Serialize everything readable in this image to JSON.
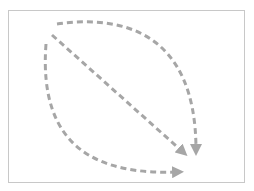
{
  "diagram": {
    "frame": {
      "x": 8,
      "y": 10,
      "width": 237,
      "height": 173,
      "border_color": "#c8c8c8"
    },
    "stroke_color": "#a6a6a6",
    "stroke_width": 3,
    "dash_pattern": "6 4",
    "paths": [
      {
        "name": "top-arc-arrow",
        "d": "M57,24 C120,15 196,30 196,150",
        "arrowhead": "down"
      },
      {
        "name": "diagonal-arrow",
        "d": "M52,35 L183,152",
        "arrowhead": "down-right"
      },
      {
        "name": "left-arc-arrow",
        "d": "M46,44 C38,150 100,175 178,172",
        "arrowhead": "right"
      }
    ]
  }
}
